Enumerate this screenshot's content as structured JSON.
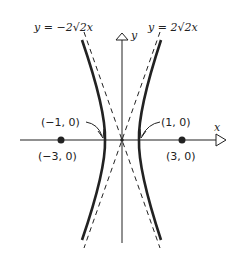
{
  "diagram": {
    "type": "hyperbola",
    "asymptotes": [
      {
        "label": "y = −2√2x",
        "slope": "-2√2"
      },
      {
        "label": "y = 2√2x",
        "slope": "2√2"
      }
    ],
    "axes": {
      "x_label": "x",
      "y_label": "y"
    },
    "vertices": [
      {
        "label": "(−1, 0)"
      },
      {
        "label": "(1, 0)"
      }
    ],
    "foci": [
      {
        "label": "(−3, 0)"
      },
      {
        "label": "(3, 0)"
      }
    ],
    "colors": {
      "ink": "#222222",
      "background": "#ffffff"
    }
  }
}
